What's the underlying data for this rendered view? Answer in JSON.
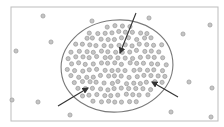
{
  "colors": {
    "background": "#ffffff",
    "frame": "#bdbdbd",
    "ellipse_stroke": "#7a7a7a",
    "dot_fill": "#c4c4c4",
    "dot_stroke": "#8e8e8e",
    "arrow": "#333333"
  },
  "frame": {
    "x": 11,
    "y": 7,
    "w": 207,
    "h": 114
  },
  "ellipse": {
    "cx": 117,
    "cy": 66,
    "rx": 56,
    "ry": 46,
    "rotate": -6
  },
  "outer_dots": [
    [
      43,
      16
    ],
    [
      51,
      42
    ],
    [
      16,
      51
    ],
    [
      92,
      21
    ],
    [
      149,
      18
    ],
    [
      183,
      34
    ],
    [
      210,
      25
    ],
    [
      12,
      100
    ],
    [
      38,
      102
    ],
    [
      70,
      115
    ],
    [
      189,
      82
    ],
    [
      171,
      112
    ],
    [
      212,
      88
    ],
    [
      211,
      117
    ]
  ],
  "arrows": [
    {
      "name": "arrow-top",
      "x1": 136,
      "y1": 13,
      "x2": 120,
      "y2": 53
    },
    {
      "name": "arrow-bottom-left",
      "x1": 58,
      "y1": 106,
      "x2": 88,
      "y2": 88
    },
    {
      "name": "arrow-right",
      "x1": 178,
      "y1": 97,
      "x2": 152,
      "y2": 82
    }
  ]
}
